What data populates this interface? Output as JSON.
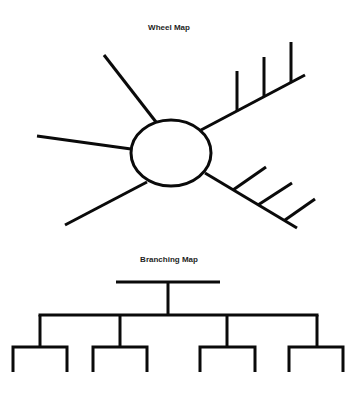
{
  "diagram": {
    "wheel_map": {
      "title": "Wheel Map",
      "center_node": {
        "shape": "ellipse",
        "cx": 171,
        "cy": 153,
        "rx": 40,
        "ry": 33
      },
      "spokes": [
        {
          "name": "upper-left",
          "x1": 156,
          "y1": 122,
          "x2": 104,
          "y2": 55
        },
        {
          "name": "left",
          "x1": 131,
          "y1": 149,
          "x2": 37,
          "y2": 136
        },
        {
          "name": "lower-left",
          "x1": 147,
          "y1": 182,
          "x2": 65,
          "y2": 225
        },
        {
          "name": "upper-right",
          "x1": 201,
          "y1": 130,
          "x2": 305,
          "y2": 75,
          "ticks": [
            {
              "x1": 237,
              "y1": 111,
              "x2": 237,
              "y2": 71
            },
            {
              "x1": 264,
              "y1": 97,
              "x2": 264,
              "y2": 57
            },
            {
              "x1": 291,
              "y1": 82,
              "x2": 291,
              "y2": 42
            }
          ]
        },
        {
          "name": "lower-right",
          "x1": 205,
          "y1": 173,
          "x2": 297,
          "y2": 228,
          "ticks": [
            {
              "x1": 233,
              "y1": 190,
              "x2": 266,
              "y2": 167
            },
            {
              "x1": 258,
              "y1": 205,
              "x2": 292,
              "y2": 183
            },
            {
              "x1": 285,
              "y1": 220,
              "x2": 315,
              "y2": 199
            }
          ]
        }
      ]
    },
    "branching_map": {
      "title": "Branching Map",
      "root_bar": {
        "x1": 116,
        "x2": 220,
        "y": 282
      },
      "stem": {
        "x": 168,
        "y1": 282,
        "y2": 315
      },
      "level1_bar": {
        "x1": 40,
        "x2": 317,
        "y": 315
      },
      "level1_drops": [
        40,
        120,
        227,
        317
      ],
      "level2_y": 347,
      "leaf_bottom_y": 372,
      "groups": [
        {
          "x1": 13,
          "x2": 67
        },
        {
          "x1": 93,
          "x2": 147
        },
        {
          "x1": 200,
          "x2": 255
        },
        {
          "x1": 289,
          "x2": 343
        }
      ]
    }
  }
}
